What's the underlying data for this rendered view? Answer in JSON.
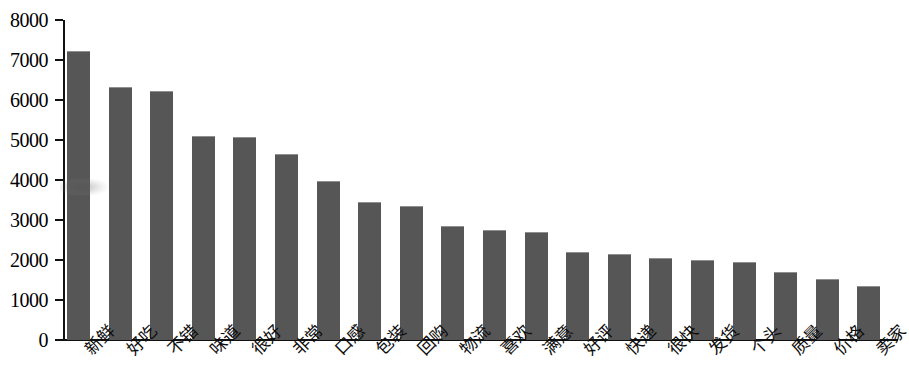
{
  "chart_data": {
    "type": "bar",
    "title": "",
    "subtitle": "",
    "xlabel": "",
    "ylabel": "",
    "ylim": [
      0,
      8000
    ],
    "ytick_values": [
      0,
      1000,
      2000,
      3000,
      4000,
      5000,
      6000,
      7000,
      8000
    ],
    "ytick_labels": [
      "0",
      "1000",
      "2000",
      "3000",
      "4000",
      "5000",
      "6000",
      "7000",
      "8000"
    ],
    "grid": false,
    "legend": null,
    "bar_color": "#565656",
    "axis_color": "#111111",
    "background_color": "#ffffff",
    "xtick_rotation": -45,
    "categories": [
      "新鲜",
      "好吃",
      "不错",
      "味道",
      "很好",
      "非常",
      "口感",
      "包装",
      "回购",
      "物流",
      "喜欢",
      "满意",
      "好评",
      "快递",
      "很快",
      "发货",
      "个头",
      "质量",
      "价格",
      "卖家"
    ],
    "values": [
      7220,
      6320,
      6220,
      5110,
      5080,
      4650,
      3970,
      3440,
      3340,
      2850,
      2760,
      2690,
      2190,
      2150,
      2060,
      2010,
      1960,
      1690,
      1520,
      1350
    ]
  }
}
